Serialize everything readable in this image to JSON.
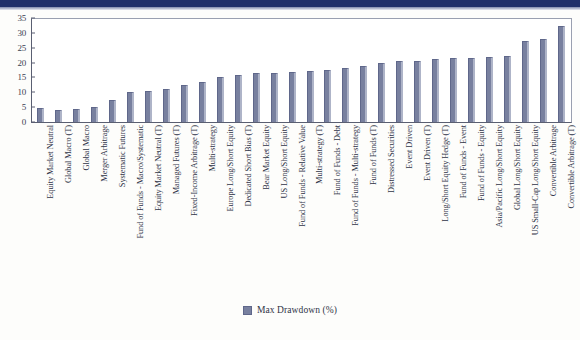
{
  "chart_data": {
    "type": "bar",
    "title": "",
    "xlabel": "",
    "ylabel": "",
    "ylim": [
      0,
      35
    ],
    "yticks": [
      0,
      5,
      10,
      15,
      20,
      25,
      30,
      35
    ],
    "grid": false,
    "legend_position": "bottom-center",
    "series_name": "Max Drawdown (%)",
    "bar_color": "#78809f",
    "categories": [
      "Equity Market Neutral",
      "Global Macro (T)",
      "Global Macro",
      "Merger Arbitrage",
      "Systematic Futures",
      "Fund of Funds - Macro/Systematic",
      "Equity Market Neutral (T)",
      "Managed Futures (T)",
      "Fixed-Income Arbitrage (T)",
      "Multi-strategy",
      "Europe Long/Short Equity",
      "Dedicated Short Bias (T)",
      "Bear Market Equity",
      "US Long/Short Equity",
      "Fund of Funds - Relative Value",
      "Multi-strategy (T)",
      "Fund of Funds - Debt",
      "Fund of Funds - Multi-strategy",
      "Fund of Funds (T)",
      "Distressed Securities",
      "Event Driven",
      "Event Driven (T)",
      "Long/Short Equity Hedge (T)",
      "Fund of Funds - Event",
      "Fund of Funds - Equity",
      "Asia/Pacific Long/Short Equity",
      "Global Long/Short Equity",
      "US Small-Cap Long/Short Equity",
      "Convertible Arbitrage",
      "Convertible Arbitrage (T)"
    ],
    "values": [
      4.7,
      4.2,
      4.3,
      5.0,
      7.4,
      10.2,
      10.3,
      11.2,
      12.4,
      13.5,
      15.0,
      15.9,
      16.4,
      16.6,
      16.9,
      17.2,
      17.5,
      18.1,
      18.9,
      20.0,
      20.5,
      20.7,
      21.2,
      21.4,
      21.5,
      21.9,
      22.2,
      27.4,
      28.1,
      32.4
    ]
  },
  "legend": {
    "label": "Max Drawdown (%)"
  }
}
